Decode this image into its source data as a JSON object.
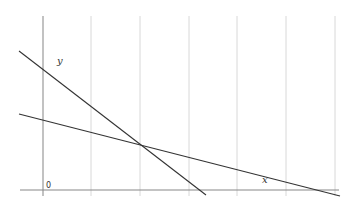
{
  "diagram": {
    "type": "two-line graph",
    "labels": {
      "y_line": "y",
      "x_line": "x",
      "origin": "0"
    },
    "colors": {
      "grid": "#d8d8d8",
      "axis": "#888888",
      "line": "#333333",
      "background": "#ffffff"
    }
  }
}
